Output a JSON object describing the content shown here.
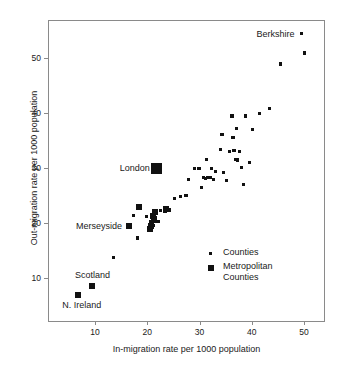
{
  "chart_data": {
    "type": "scatter",
    "title": "",
    "xlabel": "In-migration rate per 1000 population",
    "ylabel": "Out-migration rate per 1000 population",
    "xlim": [
      1,
      54
    ],
    "ylim": [
      2,
      57
    ],
    "xticks": [
      10,
      20,
      30,
      40,
      50
    ],
    "yticks": [
      10,
      20,
      30,
      40,
      50
    ],
    "grid": false,
    "legend_position": "lower-right",
    "series": [
      {
        "name": "Counties",
        "marker": "small-square",
        "color": "#111111",
        "points": [
          [
            13.6,
            13.8
          ],
          [
            18.2,
            17.3
          ],
          [
            17.3,
            21.4
          ],
          [
            19.8,
            21.2
          ],
          [
            20.6,
            20.3
          ],
          [
            21.2,
            19.6
          ],
          [
            21.6,
            21.0
          ],
          [
            22.2,
            20.3
          ],
          [
            22.6,
            22.3
          ],
          [
            23.4,
            22.2
          ],
          [
            24.3,
            22.4
          ],
          [
            25.2,
            24.5
          ],
          [
            26.4,
            24.8
          ],
          [
            27.4,
            25.0
          ],
          [
            27.9,
            28.0
          ],
          [
            29.0,
            30.0
          ],
          [
            29.9,
            30.0
          ],
          [
            30.4,
            26.5
          ],
          [
            30.8,
            28.3
          ],
          [
            31.1,
            28.2
          ],
          [
            31.3,
            31.6
          ],
          [
            31.6,
            28.3
          ],
          [
            32.0,
            28.3
          ],
          [
            32.3,
            29.9
          ],
          [
            32.6,
            27.9
          ],
          [
            33.1,
            29.4
          ],
          [
            34.0,
            33.4
          ],
          [
            34.3,
            36.1
          ],
          [
            34.6,
            29.2
          ],
          [
            35.2,
            27.8
          ],
          [
            35.7,
            33.0
          ],
          [
            36.2,
            39.5
          ],
          [
            36.4,
            35.6
          ],
          [
            36.6,
            33.2
          ],
          [
            36.9,
            31.6
          ],
          [
            37.1,
            37.2
          ],
          [
            37.3,
            31.5
          ],
          [
            37.6,
            33.1
          ],
          [
            38.1,
            30.1
          ],
          [
            38.4,
            27.0
          ],
          [
            38.8,
            39.5
          ],
          [
            39.6,
            31.0
          ],
          [
            40.2,
            37.0
          ],
          [
            41.5,
            40.0
          ],
          [
            43.4,
            40.9
          ],
          [
            45.5,
            49.0
          ],
          [
            49.5,
            54.5
          ],
          [
            50.0,
            51.0
          ]
        ]
      },
      {
        "name": "Metropolitan Counties",
        "marker": "medium-square",
        "color": "#111111",
        "points": [
          [
            6.7,
            7.0
          ],
          [
            9.5,
            8.5
          ],
          [
            16.5,
            19.4
          ],
          [
            18.5,
            22.9
          ],
          [
            20.5,
            19.0
          ],
          [
            20.8,
            19.4
          ],
          [
            21.0,
            21.3
          ],
          [
            21.3,
            20.6
          ],
          [
            21.5,
            22.0
          ],
          [
            23.5,
            22.5
          ]
        ]
      },
      {
        "name": "London",
        "marker": "large-square",
        "color": "#111111",
        "points": [
          [
            21.8,
            30.0
          ]
        ]
      }
    ],
    "annotations": [
      {
        "label": "Berkshire",
        "x": 49.5,
        "y": 54.5,
        "placement": "left"
      },
      {
        "label": "London",
        "x": 21.8,
        "y": 30.0,
        "placement": "left"
      },
      {
        "label": "Merseyside",
        "x": 16.5,
        "y": 19.4,
        "placement": "left"
      },
      {
        "label": "Scotland",
        "x": 9.5,
        "y": 8.5,
        "placement": "above"
      },
      {
        "label": "N. Ireland",
        "x": 6.7,
        "y": 7.0,
        "placement": "below"
      }
    ]
  },
  "legend": {
    "items": [
      {
        "label": "Counties",
        "marker": "small-square"
      },
      {
        "label": "Metropolitan",
        "label2": "Counties",
        "marker": "medium-square"
      }
    ]
  }
}
